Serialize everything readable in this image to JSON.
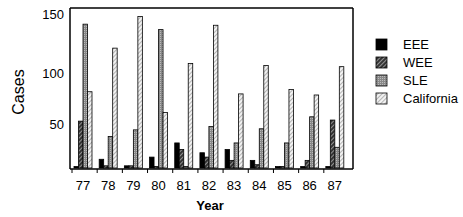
{
  "chart_data": {
    "type": "bar",
    "title": "",
    "xlabel": "Year",
    "ylabel": "Cases",
    "categories": [
      "77",
      "78",
      "79",
      "80",
      "81",
      "82",
      "83",
      "84",
      "85",
      "86",
      "87"
    ],
    "series": [
      {
        "name": "EEE",
        "pattern": "solid-black",
        "values": [
          2,
          13,
          7,
          15,
          28,
          19,
          22,
          12,
          5,
          3,
          3
        ]
      },
      {
        "name": "WEE",
        "pattern": "dark-hatched",
        "values": [
          48,
          7,
          7,
          3,
          22,
          15,
          12,
          8,
          5,
          12,
          49
        ]
      },
      {
        "name": "SLE",
        "pattern": "gray-dotted",
        "values": [
          137,
          34,
          40,
          132,
          2,
          43,
          28,
          41,
          28,
          52,
          24
        ]
      },
      {
        "name": "California",
        "pattern": "light-hatched",
        "values": [
          75,
          115,
          144,
          56,
          101,
          136,
          73,
          99,
          77,
          72,
          98
        ]
      }
    ],
    "yticks": [
      50,
      100,
      150
    ],
    "ylim": [
      5,
      150
    ],
    "grid": false,
    "legend_position": "right"
  }
}
